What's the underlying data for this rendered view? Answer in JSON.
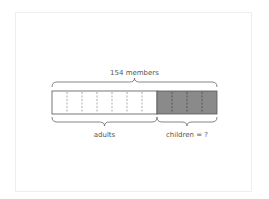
{
  "diagram": {
    "type": "tape-diagram",
    "total_label": "154 members",
    "parts": [
      {
        "label": "adults",
        "units": 7,
        "shaded": false
      },
      {
        "label": "children = ?",
        "units": 4,
        "shaded": true
      }
    ],
    "total_units": 11,
    "colors": {
      "outline": "#555555",
      "shaded_fill": "#8a8a8a",
      "unshaded_fill": "#ffffff",
      "divider": "#777777",
      "frame": "#eeeeee",
      "text": "#555555"
    }
  }
}
